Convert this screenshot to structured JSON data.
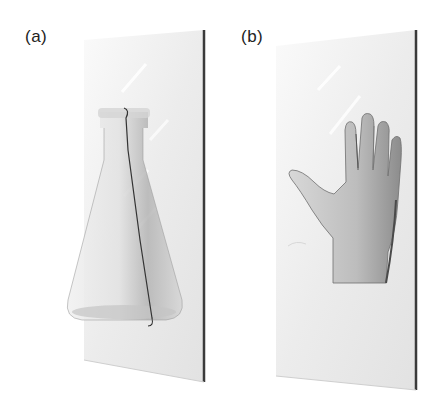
{
  "figure": {
    "panels": [
      {
        "label": "(a)",
        "subject": "glass-flask-behind-glass-pane"
      },
      {
        "label": "(b)",
        "subject": "hand-behind-glass-pane"
      }
    ],
    "colors": {
      "pane_fill": "#ececec",
      "pane_edge": "#3a3a3a",
      "flask_shade": "#b8b8b8",
      "hand_skin": "#c9c9c9",
      "hand_shadow": "#8f8f8f"
    }
  }
}
